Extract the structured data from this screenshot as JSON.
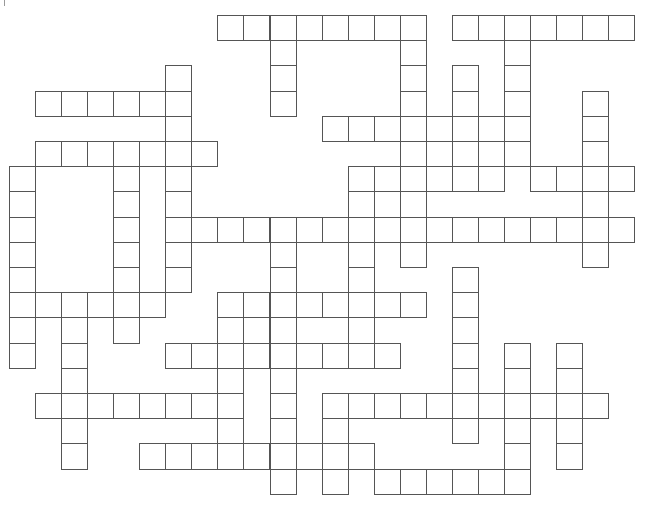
{
  "puzzle": {
    "type": "crossword",
    "grid": {
      "rows": 19,
      "cols": 24,
      "origin_x": 9,
      "origin_y": 15,
      "cell_w": 26.05,
      "cell_h": 25.2,
      "border_color": "#555555",
      "fill_color": "#ffffff"
    },
    "cells_by_row": [
      [
        [
          8,
          15
        ],
        [
          17,
          23
        ]
      ],
      [
        [
          10,
          10
        ],
        [
          15,
          15
        ],
        [
          19,
          19
        ]
      ],
      [
        [
          6,
          6
        ],
        [
          10,
          10
        ],
        [
          15,
          15
        ],
        [
          17,
          17
        ],
        [
          19,
          19
        ]
      ],
      [
        [
          1,
          6
        ],
        [
          10,
          10
        ],
        [
          15,
          15
        ],
        [
          17,
          17
        ],
        [
          19,
          19
        ],
        [
          22,
          22
        ]
      ],
      [
        [
          6,
          6
        ],
        [
          12,
          19
        ],
        [
          22,
          22
        ]
      ],
      [
        [
          1,
          7
        ],
        [
          15,
          19
        ],
        [
          22,
          22
        ]
      ],
      [
        [
          0,
          0
        ],
        [
          4,
          4
        ],
        [
          6,
          6
        ],
        [
          13,
          18
        ],
        [
          20,
          23
        ]
      ],
      [
        [
          0,
          0
        ],
        [
          4,
          4
        ],
        [
          6,
          6
        ],
        [
          13,
          15
        ],
        [
          22,
          22
        ]
      ],
      [
        [
          0,
          0
        ],
        [
          4,
          4
        ],
        [
          6,
          23
        ]
      ],
      [
        [
          0,
          0
        ],
        [
          4,
          4
        ],
        [
          6,
          6
        ],
        [
          10,
          10
        ],
        [
          13,
          13
        ],
        [
          15,
          15
        ],
        [
          22,
          22
        ]
      ],
      [
        [
          0,
          0
        ],
        [
          4,
          4
        ],
        [
          6,
          6
        ],
        [
          10,
          10
        ],
        [
          13,
          13
        ],
        [
          17,
          17
        ]
      ],
      [
        [
          0,
          5
        ],
        [
          8,
          15
        ],
        [
          17,
          17
        ]
      ],
      [
        [
          0,
          0
        ],
        [
          2,
          2
        ],
        [
          4,
          4
        ],
        [
          8,
          10
        ],
        [
          13,
          13
        ],
        [
          17,
          17
        ]
      ],
      [
        [
          0,
          0
        ],
        [
          2,
          2
        ],
        [
          6,
          14
        ],
        [
          17,
          17
        ],
        [
          19,
          19
        ],
        [
          21,
          21
        ]
      ],
      [
        [
          2,
          2
        ],
        [
          8,
          8
        ],
        [
          10,
          10
        ],
        [
          17,
          17
        ],
        [
          19,
          19
        ],
        [
          21,
          21
        ]
      ],
      [
        [
          1,
          8
        ],
        [
          10,
          10
        ],
        [
          12,
          22
        ]
      ],
      [
        [
          2,
          2
        ],
        [
          8,
          8
        ],
        [
          10,
          10
        ],
        [
          12,
          12
        ],
        [
          17,
          17
        ],
        [
          19,
          19
        ],
        [
          21,
          21
        ]
      ],
      [
        [
          2,
          2
        ],
        [
          5,
          13
        ],
        [
          19,
          19
        ],
        [
          21,
          21
        ]
      ],
      [
        [
          10,
          10
        ],
        [
          12,
          12
        ],
        [
          14,
          19
        ]
      ]
    ]
  }
}
